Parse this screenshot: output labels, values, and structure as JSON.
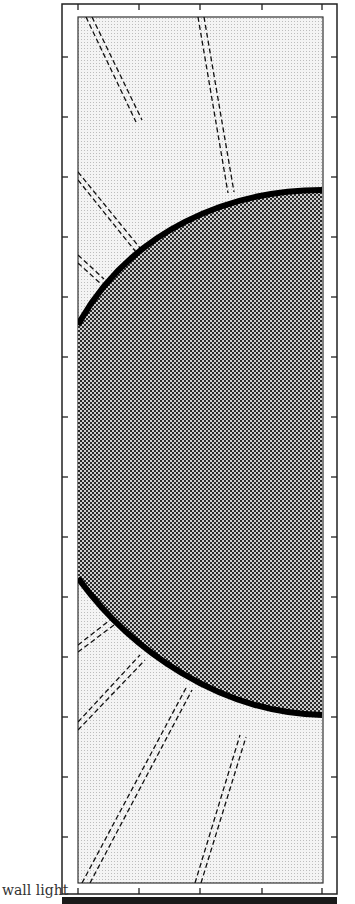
{
  "figure": {
    "type": "diagram",
    "caption": "wall light",
    "colors": {
      "frame": "#111111",
      "outer_fill": "#e4e4e4",
      "disc_fill": "#6a6a6a",
      "disc_edge": "#000000",
      "ray": "#111111",
      "background": "#ffffff"
    },
    "outer_frame": {
      "x": 62,
      "y": 4,
      "w": 275,
      "h": 890
    },
    "inner_panel": {
      "x": 78,
      "y": 17,
      "w": 245,
      "h": 866
    },
    "disc": {
      "cx": 322,
      "cy": 450,
      "r_top": 262,
      "r_bottom": 262
    },
    "ticks": {
      "top_x": [
        78,
        139,
        200,
        262,
        322
      ],
      "bottom_x": [
        78,
        139,
        200,
        262,
        322
      ],
      "left_y": [
        57,
        117,
        177,
        237,
        297,
        357,
        417,
        477,
        537,
        597,
        657,
        717,
        777,
        837
      ],
      "right_y": [
        57,
        117,
        177,
        237,
        297,
        357,
        417,
        477,
        537,
        597,
        657,
        717,
        777,
        837
      ]
    },
    "rays_top": [
      {
        "x1": 90,
        "y1": 17,
        "x2": 140,
        "y2": 120
      },
      {
        "x1": 200,
        "y1": 17,
        "x2": 230,
        "y2": 190
      },
      {
        "x1": 78,
        "y1": 175,
        "x2": 140,
        "y2": 250
      },
      {
        "x1": 78,
        "y1": 258,
        "x2": 105,
        "y2": 280
      }
    ],
    "rays_bottom": [
      {
        "x1": 78,
        "y1": 640,
        "x2": 110,
        "y2": 620
      },
      {
        "x1": 78,
        "y1": 728,
        "x2": 140,
        "y2": 660
      },
      {
        "x1": 85,
        "y1": 883,
        "x2": 190,
        "y2": 690
      },
      {
        "x1": 198,
        "y1": 883,
        "x2": 245,
        "y2": 735
      }
    ]
  }
}
